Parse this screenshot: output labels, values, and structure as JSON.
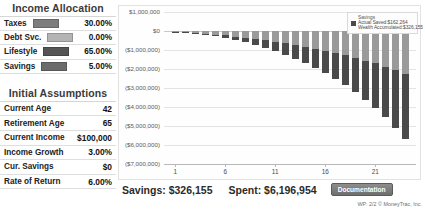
{
  "income_allocation": {
    "title": "Income Allocation",
    "rows": [
      {
        "label": "Taxes",
        "value": "30.00%",
        "color": "#7d7d7d"
      },
      {
        "label": "Debt Svc.",
        "value": "0.00%",
        "color": "#b4b4b4"
      },
      {
        "label": "Lifestyle",
        "value": "65.00%",
        "color": "#555555"
      },
      {
        "label": "Savings",
        "value": "5.00%",
        "color": "#6b6b6b"
      }
    ]
  },
  "initial_assumptions": {
    "title": "Initial Assumptions",
    "rows": [
      {
        "label": "Current Age",
        "value": "42"
      },
      {
        "label": "Retirement Age",
        "value": "65"
      },
      {
        "label": "Current Income",
        "value": "$100,000"
      },
      {
        "label": "Income Growth",
        "value": "3.00%"
      },
      {
        "label": "Cur. Savings",
        "value": "$0"
      },
      {
        "label": "Rate of Return",
        "value": "6.00%"
      }
    ]
  },
  "legend": {
    "title": "Savings",
    "entries": [
      {
        "label": "Actual Saved:$162,264",
        "color": "#4a4a4a"
      },
      {
        "label": "Wealth Accumulated:$326,155",
        "color": "#9a9a9a"
      }
    ]
  },
  "summary": {
    "savings_label": "Savings: $326,155",
    "spent_label": "Spent: $6,196,954",
    "documentation_button": "Documentation"
  },
  "footer": "WP: 2/2 © MoneyTrac, Inc.",
  "chart_data": {
    "type": "bar",
    "title": "",
    "xlabel": "",
    "ylabel": "",
    "stacked": true,
    "grid": true,
    "legend_position": "top-right",
    "ylim": [
      -7000000,
      1000000
    ],
    "ytick_labels": [
      "$1,000,000",
      "$0",
      "($1,000,000)",
      "($2,000,000)",
      "($3,000,000)",
      "($4,000,000)",
      "($5,000,000)",
      "($6,000,000)",
      "($7,000,000)"
    ],
    "ytick_values": [
      1000000,
      0,
      -1000000,
      -2000000,
      -3000000,
      -4000000,
      -5000000,
      -6000000,
      -7000000
    ],
    "xtick_labels": [
      "1",
      "6",
      "11",
      "16",
      "21"
    ],
    "xtick_values": [
      1,
      6,
      11,
      16,
      21
    ],
    "x": [
      1,
      2,
      3,
      4,
      5,
      6,
      7,
      8,
      9,
      10,
      11,
      12,
      13,
      14,
      15,
      16,
      17,
      18,
      19,
      20,
      21,
      22,
      23,
      24
    ],
    "series": [
      {
        "name": "Wealth Accumulated:$326,155",
        "color": "#9a9a9a",
        "values": [
          -30000,
          -65000,
          -100000,
          -140000,
          -185000,
          -235000,
          -290000,
          -350000,
          -415000,
          -485000,
          -560000,
          -640000,
          -730000,
          -825000,
          -925000,
          -1035000,
          -1150000,
          -1275000,
          -1410000,
          -1555000,
          -1710000,
          -1875000,
          -2055000,
          -2245000
        ]
      },
      {
        "name": "Actual Saved:$162,264",
        "color": "#4a4a4a",
        "values": [
          -10000,
          -25000,
          -45000,
          -70000,
          -100000,
          -140000,
          -190000,
          -250000,
          -320000,
          -400000,
          -495000,
          -600000,
          -720000,
          -855000,
          -1005000,
          -1175000,
          -1360000,
          -1570000,
          -1800000,
          -2060000,
          -2350000,
          -2670000,
          -3030000,
          -3430000
        ]
      }
    ],
    "totals": [
      -40000,
      -90000,
      -145000,
      -210000,
      -285000,
      -375000,
      -480000,
      -600000,
      -735000,
      -885000,
      -1055000,
      -1240000,
      -1450000,
      -1680000,
      -1930000,
      -2210000,
      -2510000,
      -2845000,
      -3210000,
      -3615000,
      -4060000,
      -4545000,
      -5085000,
      -5675000
    ]
  }
}
